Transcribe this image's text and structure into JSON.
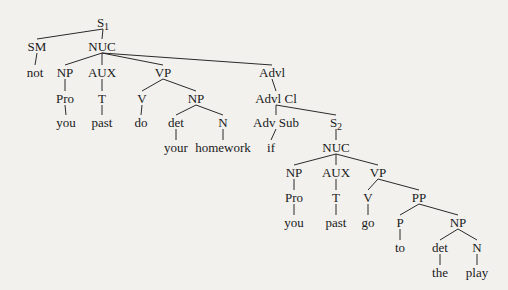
{
  "diagram": {
    "type": "syntax-tree",
    "background": "#f2f1ee",
    "line_color": "#2a2a2a",
    "nodes": [
      {
        "id": "s1",
        "label": "S",
        "sub": "1",
        "x": 103,
        "y": 22
      },
      {
        "id": "sm",
        "label": "SM",
        "x": 37,
        "y": 46
      },
      {
        "id": "nuc1",
        "label": "NUC",
        "x": 102,
        "y": 46
      },
      {
        "id": "not",
        "label": "not",
        "x": 35,
        "y": 72
      },
      {
        "id": "np1",
        "label": "NP",
        "x": 65,
        "y": 72
      },
      {
        "id": "aux1",
        "label": "AUX",
        "x": 102,
        "y": 72
      },
      {
        "id": "vp1",
        "label": "VP",
        "x": 163,
        "y": 72
      },
      {
        "id": "advl",
        "label": "Advl",
        "x": 272,
        "y": 72
      },
      {
        "id": "pro1",
        "label": "Pro",
        "x": 65,
        "y": 98
      },
      {
        "id": "t1",
        "label": "T",
        "x": 102,
        "y": 98
      },
      {
        "id": "v1",
        "label": "V",
        "x": 142,
        "y": 98
      },
      {
        "id": "np2",
        "label": "NP",
        "x": 196,
        "y": 98
      },
      {
        "id": "advlcl",
        "label": "Advl Cl",
        "x": 276,
        "y": 98
      },
      {
        "id": "you1",
        "label": "you",
        "x": 66,
        "y": 122
      },
      {
        "id": "past1",
        "label": "past",
        "x": 102,
        "y": 122
      },
      {
        "id": "do",
        "label": "do",
        "x": 141,
        "y": 122
      },
      {
        "id": "det1",
        "label": "det",
        "x": 176,
        "y": 122
      },
      {
        "id": "n1",
        "label": "N",
        "x": 223,
        "y": 122
      },
      {
        "id": "advsub",
        "label": "Adv Sub",
        "x": 276,
        "y": 122
      },
      {
        "id": "s2",
        "label": "S",
        "sub": "2",
        "x": 336,
        "y": 122
      },
      {
        "id": "your",
        "label": "your",
        "x": 176,
        "y": 147
      },
      {
        "id": "homework",
        "label": "homework",
        "x": 223,
        "y": 147
      },
      {
        "id": "if",
        "label": "if",
        "x": 271,
        "y": 147
      },
      {
        "id": "nuc2",
        "label": "NUC",
        "x": 336,
        "y": 147
      },
      {
        "id": "np3",
        "label": "NP",
        "x": 294,
        "y": 172
      },
      {
        "id": "aux2",
        "label": "AUX",
        "x": 336,
        "y": 172
      },
      {
        "id": "vp2",
        "label": "VP",
        "x": 378,
        "y": 172
      },
      {
        "id": "pro2",
        "label": "Pro",
        "x": 294,
        "y": 197
      },
      {
        "id": "t2",
        "label": "T",
        "x": 336,
        "y": 197
      },
      {
        "id": "v2",
        "label": "V",
        "x": 368,
        "y": 197
      },
      {
        "id": "pp",
        "label": "PP",
        "x": 419,
        "y": 197
      },
      {
        "id": "you2",
        "label": "you",
        "x": 294,
        "y": 222
      },
      {
        "id": "past2",
        "label": "past",
        "x": 336,
        "y": 222
      },
      {
        "id": "go",
        "label": "go",
        "x": 368,
        "y": 222
      },
      {
        "id": "p",
        "label": "P",
        "x": 400,
        "y": 222
      },
      {
        "id": "np4",
        "label": "NP",
        "x": 458,
        "y": 222
      },
      {
        "id": "to",
        "label": "to",
        "x": 400,
        "y": 247
      },
      {
        "id": "det2",
        "label": "det",
        "x": 440,
        "y": 247
      },
      {
        "id": "n2",
        "label": "N",
        "x": 477,
        "y": 247
      },
      {
        "id": "the",
        "label": "the",
        "x": 440,
        "y": 272
      },
      {
        "id": "play",
        "label": "play",
        "x": 477,
        "y": 272
      }
    ],
    "edges": [
      [
        "s1",
        "sm"
      ],
      [
        "s1",
        "nuc1"
      ],
      [
        "sm",
        "not"
      ],
      [
        "nuc1",
        "np1"
      ],
      [
        "nuc1",
        "aux1"
      ],
      [
        "nuc1",
        "vp1"
      ],
      [
        "nuc1",
        "advl"
      ],
      [
        "np1",
        "pro1"
      ],
      [
        "pro1",
        "you1"
      ],
      [
        "aux1",
        "t1"
      ],
      [
        "t1",
        "past1"
      ],
      [
        "vp1",
        "v1"
      ],
      [
        "vp1",
        "np2"
      ],
      [
        "v1",
        "do"
      ],
      [
        "np2",
        "det1"
      ],
      [
        "np2",
        "n1"
      ],
      [
        "det1",
        "your"
      ],
      [
        "n1",
        "homework"
      ],
      [
        "advl",
        "advlcl"
      ],
      [
        "advlcl",
        "advsub"
      ],
      [
        "advlcl",
        "s2"
      ],
      [
        "advsub",
        "if"
      ],
      [
        "s2",
        "nuc2"
      ],
      [
        "nuc2",
        "np3"
      ],
      [
        "nuc2",
        "aux2"
      ],
      [
        "nuc2",
        "vp2"
      ],
      [
        "np3",
        "pro2"
      ],
      [
        "pro2",
        "you2"
      ],
      [
        "aux2",
        "t2"
      ],
      [
        "t2",
        "past2"
      ],
      [
        "vp2",
        "v2"
      ],
      [
        "vp2",
        "pp"
      ],
      [
        "v2",
        "go"
      ],
      [
        "pp",
        "p"
      ],
      [
        "pp",
        "np4"
      ],
      [
        "p",
        "to"
      ],
      [
        "np4",
        "det2"
      ],
      [
        "np4",
        "n2"
      ],
      [
        "det2",
        "the"
      ],
      [
        "n2",
        "play"
      ]
    ]
  }
}
